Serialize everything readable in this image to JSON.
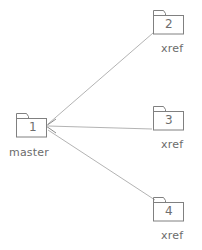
{
  "diagram": {
    "colors": {
      "folder_outline": "#808080",
      "connector_line": "#aaaaaa",
      "text": "#6b6b6b",
      "background": "#ffffff"
    },
    "nodes": [
      {
        "id": "master",
        "number": "1",
        "label": "master",
        "x": 15,
        "y": 112,
        "width": 32,
        "height": 25,
        "label_x": 9,
        "label_y": 146,
        "num_x": 28,
        "num_y": 120
      },
      {
        "id": "xref-2",
        "number": "2",
        "label": "xref",
        "x": 152,
        "y": 9,
        "width": 32,
        "height": 25,
        "label_x": 161,
        "label_y": 42,
        "num_x": 165,
        "num_y": 17
      },
      {
        "id": "xref-3",
        "number": "3",
        "label": "xref",
        "x": 152,
        "y": 105,
        "width": 32,
        "height": 25,
        "label_x": 161,
        "label_y": 138,
        "num_x": 165,
        "num_y": 113
      },
      {
        "id": "xref-4",
        "number": "4",
        "label": "xref",
        "x": 152,
        "y": 196,
        "width": 32,
        "height": 25,
        "label_x": 161,
        "label_y": 229,
        "num_x": 165,
        "num_y": 204
      }
    ],
    "connectors": [
      {
        "id": "master-to-xref-2",
        "from": "xref-2",
        "to": "master",
        "x1": 153,
        "y1": 33,
        "x2": 48,
        "y2": 124
      },
      {
        "id": "master-to-xref-3",
        "from": "xref-3",
        "to": "master",
        "x1": 152,
        "y1": 129,
        "x2": 48,
        "y2": 126
      },
      {
        "id": "master-to-xref-4",
        "from": "xref-4",
        "to": "master",
        "x1": 155,
        "y1": 200,
        "x2": 48,
        "y2": 130
      }
    ],
    "arrowhead": {
      "id": "arrow-into-master",
      "points": "56,119 46,126 56,133",
      "target": "master"
    }
  }
}
